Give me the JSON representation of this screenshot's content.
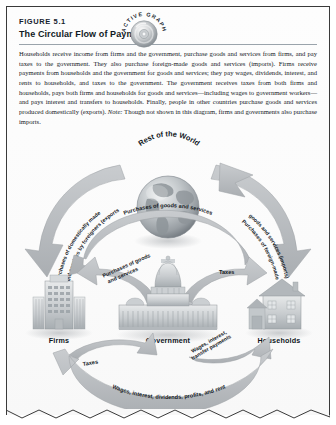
{
  "figure": {
    "number": "FIGURE 5.1",
    "title": "The Circular Flow of Payments",
    "badge": {
      "name": "active-graph-badge",
      "line1": "ACTIVE",
      "line2": "GRAPH"
    },
    "caption": {
      "part1": "Households receive income from firms and the government, purchase goods and services from firms, and pay taxes to the government. They also purchase foreign-made goods and services (imports). Firms receive payments from households and the government for goods and services; they pay wages, dividends, interest, and rents to households, and taxes to the government. The government receives taxes from both firms and households, pays both firms and households for goods and services—including wages to government workers—and pays interest and transfers to households. Finally, people in other countries purchase goods and services produced domestically (exports). ",
      "note_word": "Note:",
      "part2": " Though not shown in this diagram, firms and governments also purchase imports."
    }
  },
  "diagram": {
    "nodes": [
      {
        "id": "rest-of-the-world",
        "label": "Rest of the World"
      },
      {
        "id": "firms",
        "label": "Firms"
      },
      {
        "id": "government",
        "label": "Government"
      },
      {
        "id": "households",
        "label": "Households"
      }
    ],
    "flows": [
      {
        "id": "exports",
        "label": "Purchases of domestically made goods and services by foreigners (exports)",
        "line1": "Purchases of domestically made",
        "line2": "goods and services by foreigners (exports)"
      },
      {
        "id": "imports",
        "label": "Purchases of foreign-made goods and services (imports)",
        "line1": "Purchases of foreign-made",
        "line2": "goods and services (imports)"
      },
      {
        "id": "purchases-goods-services-top",
        "label": "Purchases of goods and services"
      },
      {
        "id": "purchases-goods-services-gov-firms",
        "line1": "Purchases of goods",
        "line2": "and services"
      },
      {
        "id": "taxes-gov-households",
        "label": "Taxes"
      },
      {
        "id": "taxes-firms-gov",
        "label": "Taxes"
      },
      {
        "id": "wages-interest-transfers",
        "line1": "Wages, interest,",
        "line2": "transfer payments"
      },
      {
        "id": "factor-payments",
        "label": "Wages, interest, dividends, profits, and rent"
      }
    ]
  },
  "colors": {
    "arrow_fill": "#b9bcbe",
    "arrow_stroke": "#9b9fa2",
    "text": "#13181d",
    "border": "#3a3a3a",
    "page": "#ffffff"
  }
}
